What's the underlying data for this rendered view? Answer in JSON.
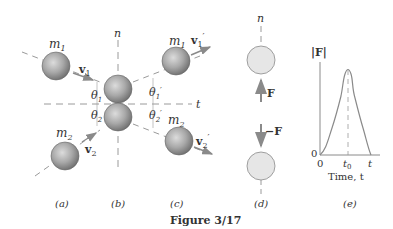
{
  "figure": {
    "caption": "Figure 3/17",
    "colors": {
      "sphere_dark": "#8a8a8a",
      "sphere_light": "#d9d9d9",
      "pale_sphere": "#e6e6e6",
      "dashed_line": "#9a9a9a",
      "arrow": "#8a8a8a",
      "curve": "#8a8a8a",
      "text": "#333333"
    }
  },
  "panels": {
    "a": {
      "label": "(a)",
      "m1": "m",
      "m1_sub": "1",
      "v1": "v",
      "v1_sub": "1",
      "m2": "m",
      "m2_sub": "2",
      "v2": "v",
      "v2_sub": "2"
    },
    "b": {
      "label": "(b)",
      "n_axis": "n",
      "t_axis": "t",
      "theta1": "θ",
      "theta1_sub": "1",
      "theta2": "θ",
      "theta2_sub": "2"
    },
    "c": {
      "label": "(c)",
      "m1": "m",
      "m1_sub": "1",
      "v1p": "v",
      "v1p_sub": "1",
      "v1p_prime": "′",
      "m2": "m",
      "m2_sub": "2",
      "v2p": "v",
      "v2p_sub": "2",
      "v2p_prime": "′",
      "theta1p": "θ",
      "theta1p_sub": "1",
      "theta1p_prime": "′",
      "theta2p": "θ",
      "theta2p_sub": "2",
      "theta2p_prime": "′"
    },
    "d": {
      "label": "(d)",
      "n_axis": "n",
      "force_up": "F",
      "force_down": "−F"
    },
    "e": {
      "label": "(e)",
      "y_label": "|F|",
      "y_origin": "0",
      "x_origin": "0",
      "x_tick_t0": "t",
      "x_tick_t0_sub": "0",
      "x_tick_t": "t",
      "x_title": "Time, t"
    }
  }
}
